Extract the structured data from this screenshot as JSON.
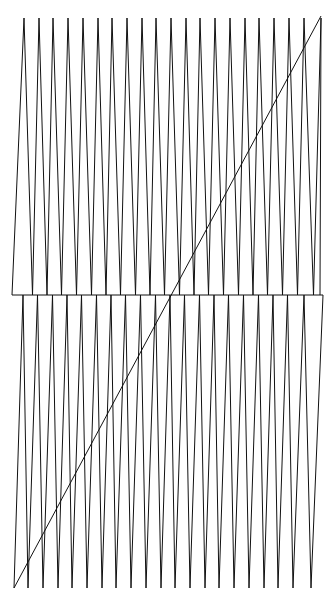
{
  "figure": {
    "width": 334,
    "height": 596,
    "background": "#ffffff",
    "stroke_color": "#111111",
    "stroke_width": 1
  },
  "geometry": {
    "top_y": 18,
    "mid_y": 295,
    "bottom_y": 588,
    "left_x": 12,
    "right_x": 323,
    "top_peaks_x": [
      24,
      39,
      53,
      68,
      83,
      98,
      112,
      127,
      142,
      156,
      171,
      186,
      200,
      215,
      230,
      245,
      259,
      274,
      289,
      304,
      321
    ],
    "bottom_valleys_x": [
      14,
      28,
      43,
      58,
      72,
      87,
      102,
      116,
      131,
      146,
      161,
      175,
      190,
      205,
      219,
      234,
      249,
      264,
      278,
      293,
      311
    ],
    "diagonal": {
      "x1": 14,
      "y1": 588,
      "x2": 321,
      "y2": 16
    },
    "horizontal_line": {
      "x1": 12,
      "y1": 295,
      "x2": 323,
      "y2": 295
    }
  }
}
